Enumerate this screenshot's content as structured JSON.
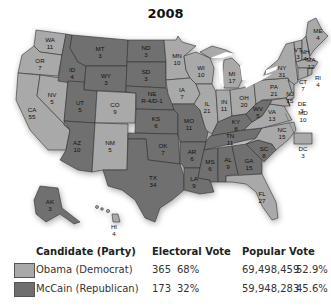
{
  "title": "2008",
  "colors": {
    "democrat": "#a9a9a9",
    "republican": "#6f6f6f"
  },
  "states": [
    {
      "abbr": "WA",
      "ev": "11",
      "party": "dem"
    },
    {
      "abbr": "OR",
      "ev": "7",
      "party": "dem"
    },
    {
      "abbr": "CA",
      "ev": "55",
      "party": "dem"
    },
    {
      "abbr": "NV",
      "ev": "5",
      "party": "dem"
    },
    {
      "abbr": "ID",
      "ev": "4",
      "party": "rep"
    },
    {
      "abbr": "MT",
      "ev": "3",
      "party": "rep"
    },
    {
      "abbr": "WY",
      "ev": "3",
      "party": "rep"
    },
    {
      "abbr": "UT",
      "ev": "5",
      "party": "rep"
    },
    {
      "abbr": "AZ",
      "ev": "10",
      "party": "rep"
    },
    {
      "abbr": "CO",
      "ev": "9",
      "party": "dem"
    },
    {
      "abbr": "NM",
      "ev": "5",
      "party": "dem"
    },
    {
      "abbr": "ND",
      "ev": "3",
      "party": "rep"
    },
    {
      "abbr": "SD",
      "ev": "3",
      "party": "rep"
    },
    {
      "abbr": "NE",
      "ev": "R-4/D-1",
      "party": "rep"
    },
    {
      "abbr": "KS",
      "ev": "6",
      "party": "rep"
    },
    {
      "abbr": "OK",
      "ev": "7",
      "party": "rep"
    },
    {
      "abbr": "TX",
      "ev": "34",
      "party": "rep"
    },
    {
      "abbr": "MN",
      "ev": "10",
      "party": "dem"
    },
    {
      "abbr": "IA",
      "ev": "7",
      "party": "dem"
    },
    {
      "abbr": "MO",
      "ev": "11",
      "party": "rep"
    },
    {
      "abbr": "AR",
      "ev": "6",
      "party": "rep"
    },
    {
      "abbr": "LA",
      "ev": "9",
      "party": "rep"
    },
    {
      "abbr": "WI",
      "ev": "10",
      "party": "dem"
    },
    {
      "abbr": "IL",
      "ev": "21",
      "party": "dem"
    },
    {
      "abbr": "MI",
      "ev": "17",
      "party": "dem"
    },
    {
      "abbr": "IN",
      "ev": "11",
      "party": "dem"
    },
    {
      "abbr": "OH",
      "ev": "20",
      "party": "dem"
    },
    {
      "abbr": "KY",
      "ev": "8",
      "party": "rep"
    },
    {
      "abbr": "TN",
      "ev": "11",
      "party": "rep"
    },
    {
      "abbr": "MS",
      "ev": "6",
      "party": "rep"
    },
    {
      "abbr": "AL",
      "ev": "9",
      "party": "rep"
    },
    {
      "abbr": "GA",
      "ev": "15",
      "party": "rep"
    },
    {
      "abbr": "FL",
      "ev": "27",
      "party": "dem"
    },
    {
      "abbr": "SC",
      "ev": "8",
      "party": "rep"
    },
    {
      "abbr": "NC",
      "ev": "15",
      "party": "dem"
    },
    {
      "abbr": "VA",
      "ev": "13",
      "party": "dem"
    },
    {
      "abbr": "WV",
      "ev": "5",
      "party": "rep"
    },
    {
      "abbr": "PA",
      "ev": "21",
      "party": "dem"
    },
    {
      "abbr": "NY",
      "ev": "31",
      "party": "dem"
    },
    {
      "abbr": "VT",
      "ev": "3",
      "party": "dem"
    },
    {
      "abbr": "NH",
      "ev": "4",
      "party": "dem"
    },
    {
      "abbr": "ME",
      "ev": "4",
      "party": "dem"
    },
    {
      "abbr": "MA",
      "ev": "12",
      "party": "dem"
    },
    {
      "abbr": "RI",
      "ev": "4",
      "party": "dem"
    },
    {
      "abbr": "CT",
      "ev": "7",
      "party": "dem"
    },
    {
      "abbr": "NJ",
      "ev": "15",
      "party": "dem"
    },
    {
      "abbr": "DE",
      "ev": "3",
      "party": "dem"
    },
    {
      "abbr": "MD",
      "ev": "10",
      "party": "dem"
    },
    {
      "abbr": "DC",
      "ev": "3",
      "party": "dem"
    },
    {
      "abbr": "AK",
      "ev": "3",
      "party": "rep"
    },
    {
      "abbr": "HI",
      "ev": "4",
      "party": "dem"
    }
  ],
  "legend": {
    "headers": {
      "candidate": "Candidate (Party)",
      "electoral": "Electoral Vote",
      "popular": "Popular Vote"
    },
    "rows": [
      {
        "candidate": "Obama (Democrat)",
        "ev": "365",
        "ev_pct": "68%",
        "pop": "69,498,459",
        "pop_pct": "52.9%",
        "party": "dem"
      },
      {
        "candidate": "McCain (Republican)",
        "ev": "173",
        "ev_pct": "32%",
        "pop": "59,948,283",
        "pop_pct": "45.6%",
        "party": "rep"
      }
    ]
  }
}
